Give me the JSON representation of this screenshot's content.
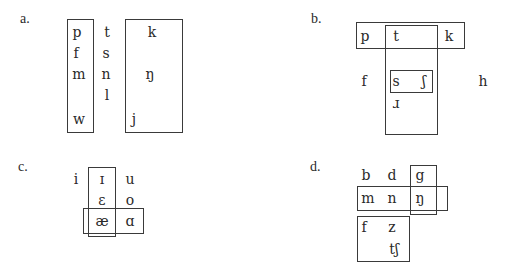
{
  "panels": {
    "a": {
      "label": "a.",
      "symbols": [
        "p",
        "f",
        "m",
        "w",
        "t",
        "s",
        "n",
        "l",
        "k",
        "ŋ",
        "j"
      ]
    },
    "b": {
      "label": "b.",
      "symbols": [
        "p",
        "t",
        "k",
        "f",
        "s",
        "ʃ",
        "h",
        "ɹ"
      ]
    },
    "c": {
      "label": "c.",
      "symbols": [
        "i",
        "ɪ",
        "u",
        "ɛ",
        "o",
        "æ",
        "ɑ"
      ]
    },
    "d": {
      "label": "d.",
      "symbols": [
        "b",
        "d",
        "g",
        "m",
        "n",
        "ŋ",
        "f",
        "z",
        "tʃ"
      ]
    }
  }
}
